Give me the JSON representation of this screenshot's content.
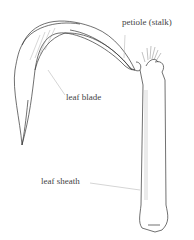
{
  "diagram": {
    "labels": {
      "petiole": "petiole (stalk)",
      "leaf_blade": "leaf blade",
      "leaf_sheath": "leaf sheath"
    },
    "colors": {
      "line": "#333333",
      "leader": "#aaaaaa",
      "hatch": "#777777"
    }
  }
}
